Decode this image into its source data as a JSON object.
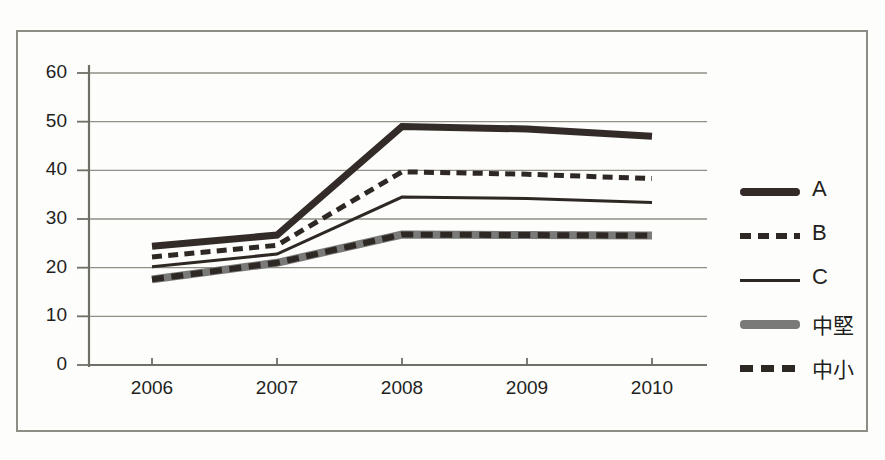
{
  "chart_data": {
    "type": "line",
    "title": "",
    "subtitle": "",
    "xlabel": "",
    "ylabel": "",
    "categories": [
      "2006",
      "2007",
      "2008",
      "2009",
      "2010"
    ],
    "x_tick_labels": [
      "2006",
      "2007",
      "2008",
      "2009",
      "2010"
    ],
    "y_tick_labels": [
      "0",
      "10",
      "20",
      "30",
      "40",
      "50",
      "60"
    ],
    "y_ticks": [
      0,
      10,
      20,
      30,
      40,
      50,
      60
    ],
    "ylim": [
      0,
      60
    ],
    "grid": "horizontal",
    "legend_position": "right",
    "series": [
      {
        "name": "A",
        "values": [
          24.4,
          26.7,
          49.0,
          48.5,
          47.0
        ],
        "style": "solid",
        "width": 7,
        "color": "#332b27"
      },
      {
        "name": "B",
        "values": [
          22.2,
          24.6,
          39.7,
          39.2,
          38.3
        ],
        "style": "dashed",
        "width": 5,
        "color": "#2e2824"
      },
      {
        "name": "C",
        "values": [
          20.2,
          22.8,
          34.5,
          34.2,
          33.4
        ],
        "style": "solid",
        "width": 3,
        "color": "#2e2824"
      },
      {
        "name": "中堅",
        "values": [
          17.6,
          21.0,
          26.8,
          26.7,
          26.6
        ],
        "style": "solid",
        "width": 8,
        "color": "#7a7a78"
      },
      {
        "name": "中小",
        "values": [
          17.6,
          21.0,
          26.8,
          26.7,
          26.6
        ],
        "style": "dashed",
        "width": 6,
        "color": "#2e2824"
      }
    ]
  },
  "axes": {
    "axis_color": "#6f6f67",
    "grid_color": "#8f8f86",
    "tick_text_color": "#231f1d"
  },
  "frame": {
    "border_color": "#8d8d85",
    "background": "#fdfdfb"
  },
  "legend": {
    "items": [
      {
        "label": "A",
        "style": "solid",
        "width": 8,
        "color": "#332b27",
        "cjk": false
      },
      {
        "label": "B",
        "style": "dashed",
        "width": 6,
        "color": "#2e2824",
        "cjk": false
      },
      {
        "label": "C",
        "style": "solid",
        "width": 3,
        "color": "#2e2824",
        "cjk": false
      },
      {
        "label": "中堅",
        "style": "solid",
        "width": 9,
        "color": "#7a7a78",
        "cjk": true
      },
      {
        "label": "中小",
        "style": "dashed",
        "width": 7,
        "color": "#2e2824",
        "cjk": true
      }
    ]
  }
}
